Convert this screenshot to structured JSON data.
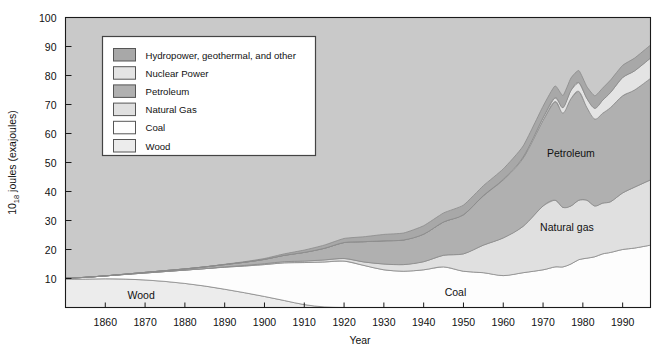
{
  "figure": {
    "background_color": "#ffffff",
    "plot_background_color": "#c9c9c9",
    "plot_border_color": "#1a1a1a"
  },
  "axes": {
    "x_title": "Year",
    "y_title_main": "10",
    "y_title_sub": "18",
    "y_title_rest": " joules (exajoules)",
    "y_ticks": [
      "10",
      "20",
      "30",
      "40",
      "50",
      "60",
      "70",
      "80",
      "90",
      "100"
    ],
    "y_tick_values": [
      10,
      20,
      30,
      40,
      50,
      60,
      70,
      80,
      90,
      100
    ],
    "x_ticks": [
      "1860",
      "1870",
      "1880",
      "1890",
      "1900",
      "1910",
      "1920",
      "1930",
      "1940",
      "1950",
      "1960",
      "1970",
      "1980",
      "1990"
    ],
    "x_tick_values": [
      1860,
      1870,
      1880,
      1890,
      1900,
      1910,
      1920,
      1930,
      1940,
      1950,
      1960,
      1970,
      1980,
      1990
    ]
  },
  "legend": {
    "border_color": "#444444",
    "background_color": "#ffffff",
    "items": [
      {
        "label": "Hydropower, geothermal, and other",
        "color": "#a8a8a8",
        "swatch_name": "legend-swatch-hydropower"
      },
      {
        "label": "Nuclear Power",
        "color": "#e4e4e4",
        "swatch_name": "legend-swatch-nuclear"
      },
      {
        "label": "Petroleum",
        "color": "#b0b0b0",
        "swatch_name": "legend-swatch-petroleum"
      },
      {
        "label": "Natural Gas",
        "color": "#e0e0e0",
        "swatch_name": "legend-swatch-natural-gas"
      },
      {
        "label": "Coal",
        "color": "#fdfdfd",
        "swatch_name": "legend-swatch-coal"
      },
      {
        "label": "Wood",
        "color": "#ececec",
        "swatch_name": "legend-swatch-wood"
      }
    ]
  },
  "area_labels": [
    {
      "text": "Wood",
      "x": 1869,
      "y": 3.0,
      "name": "area-label-wood"
    },
    {
      "text": "Coal",
      "x": 1948,
      "y": 4.0,
      "name": "area-label-coal"
    },
    {
      "text": "Natural gas",
      "x": 1976,
      "y": 26.5,
      "name": "area-label-natural-gas"
    },
    {
      "text": "Petroleum",
      "x": 1977,
      "y": 52.0,
      "name": "area-label-petroleum"
    }
  ],
  "chart_data": {
    "type": "area",
    "title": "",
    "subtitle": "",
    "xlabel": "Year",
    "ylabel": "10^18 joules (exajoules)",
    "xlim": [
      1850,
      1997
    ],
    "ylim": [
      0,
      100
    ],
    "grid": false,
    "stacked": true,
    "legend_position": "upper-left-inside",
    "x": [
      1850,
      1855,
      1860,
      1865,
      1870,
      1875,
      1880,
      1885,
      1890,
      1895,
      1900,
      1905,
      1910,
      1915,
      1920,
      1925,
      1930,
      1935,
      1940,
      1945,
      1950,
      1955,
      1960,
      1965,
      1970,
      1973,
      1975,
      1977,
      1979,
      1981,
      1983,
      1985,
      1987,
      1990,
      1993,
      1997
    ],
    "series": [
      {
        "name": "Wood",
        "color": "#ececec",
        "values": [
          9.8,
          9.8,
          9.9,
          9.8,
          9.5,
          9.0,
          8.3,
          7.4,
          6.3,
          5.1,
          3.8,
          2.4,
          1.0,
          0.2,
          0.0,
          0.0,
          0.0,
          0.0,
          0.0,
          0.0,
          0.0,
          0.0,
          0.0,
          0.0,
          0.0,
          0.0,
          0.0,
          0.0,
          0.0,
          0.0,
          0.0,
          0.0,
          0.0,
          0.0,
          0.0,
          0.0
        ]
      },
      {
        "name": "Coal",
        "color": "#fdfdfd",
        "values": [
          0.3,
          0.6,
          1.0,
          1.6,
          2.4,
          3.4,
          4.6,
          6.0,
          7.6,
          9.2,
          11.0,
          13.0,
          14.5,
          15.5,
          16.0,
          14.5,
          13.0,
          12.5,
          13.0,
          14.0,
          12.5,
          12.0,
          11.0,
          12.0,
          13.0,
          14.0,
          14.0,
          15.0,
          16.5,
          17.0,
          17.5,
          18.5,
          19.0,
          20.0,
          20.5,
          21.5
        ]
      },
      {
        "name": "Natural Gas",
        "color": "#e0e0e0",
        "values": [
          0.0,
          0.0,
          0.0,
          0.0,
          0.0,
          0.0,
          0.0,
          0.0,
          0.1,
          0.2,
          0.3,
          0.4,
          0.5,
          0.7,
          0.9,
          1.2,
          2.0,
          2.3,
          2.8,
          4.0,
          6.0,
          9.5,
          13.0,
          16.0,
          22.0,
          23.0,
          20.5,
          20.0,
          20.5,
          20.0,
          17.5,
          17.5,
          17.5,
          19.5,
          21.0,
          22.5
        ]
      },
      {
        "name": "Petroleum",
        "color": "#b0b0b0",
        "values": [
          0.0,
          0.0,
          0.0,
          0.1,
          0.2,
          0.3,
          0.4,
          0.6,
          0.8,
          1.1,
          1.5,
          2.2,
          3.0,
          4.0,
          5.5,
          7.0,
          8.0,
          8.5,
          9.5,
          11.5,
          13.5,
          17.0,
          20.0,
          23.5,
          29.5,
          34.0,
          32.5,
          37.0,
          37.5,
          32.0,
          30.0,
          31.0,
          32.5,
          33.5,
          33.5,
          35.0
        ]
      },
      {
        "name": "Nuclear Power",
        "color": "#e4e4e4",
        "values": [
          0.0,
          0.0,
          0.0,
          0.0,
          0.0,
          0.0,
          0.0,
          0.0,
          0.0,
          0.0,
          0.0,
          0.0,
          0.0,
          0.0,
          0.0,
          0.0,
          0.0,
          0.0,
          0.0,
          0.0,
          0.0,
          0.1,
          0.2,
          0.4,
          0.9,
          1.3,
          1.9,
          2.8,
          3.0,
          3.1,
          3.7,
          4.5,
          5.2,
          6.3,
          6.6,
          7.0
        ]
      },
      {
        "name": "Hydropower, geothermal, and other",
        "color": "#a8a8a8",
        "values": [
          0.0,
          0.0,
          0.0,
          0.0,
          0.0,
          0.0,
          0.0,
          0.0,
          0.1,
          0.2,
          0.3,
          0.5,
          0.8,
          1.1,
          1.4,
          1.7,
          2.2,
          2.4,
          2.9,
          3.1,
          3.3,
          3.4,
          3.6,
          3.8,
          4.0,
          4.1,
          4.2,
          4.3,
          4.2,
          4.1,
          4.3,
          4.2,
          4.3,
          4.2,
          4.4,
          4.5
        ]
      }
    ]
  }
}
